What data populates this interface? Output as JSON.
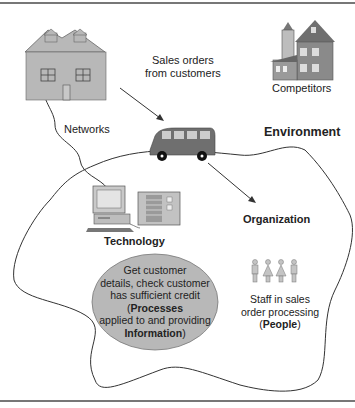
{
  "diagram": {
    "sales_orders_label": [
      "Sales orders",
      "from customers"
    ],
    "networks_label": "Networks",
    "competitors_label": "Competitors",
    "environment_label": "Environment",
    "organization_label": "Organization",
    "technology_label": "Technology",
    "processes_text": {
      "line1": "Get customer",
      "line2": "details, check customer",
      "line3": "has sufficient credit",
      "line4_open": "(",
      "line4_bold": "Processes",
      "line5": "applied to and providing",
      "line6_bold": "Information",
      "line6_close": ")"
    },
    "people_text": {
      "line1": "Staff in sales",
      "line2": "order processing",
      "line3_open": "(",
      "line3_bold": "People",
      "line3_close": ")"
    },
    "colors": {
      "fill_gray": "#b8b8b8",
      "dark_gray": "#6f6f6f",
      "line": "#333333"
    }
  }
}
